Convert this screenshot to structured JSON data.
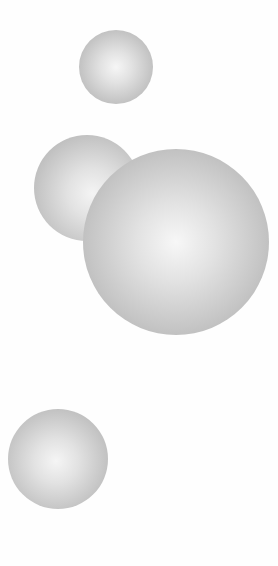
{
  "scene": {
    "width": 278,
    "height": 566,
    "background": "#fefefe",
    "spheres": [
      {
        "name": "sphere-top-small",
        "cx": 116,
        "cy": 67,
        "r": 37,
        "highlight_x": 50,
        "highlight_y": 50,
        "center_color": "#f6f6f6",
        "edge_color": "#acacac",
        "z": 1
      },
      {
        "name": "sphere-middle-left",
        "cx": 87,
        "cy": 188,
        "r": 53,
        "highlight_x": 55,
        "highlight_y": 55,
        "center_color": "#f4f4f4",
        "edge_color": "#aaaaaa",
        "z": 1
      },
      {
        "name": "sphere-large",
        "cx": 176,
        "cy": 242,
        "r": 93,
        "highlight_x": 50,
        "highlight_y": 50,
        "center_color": "#f7f7f7",
        "edge_color": "#a8a8a8",
        "z": 2
      },
      {
        "name": "sphere-bottom-left",
        "cx": 58,
        "cy": 459,
        "r": 50,
        "highlight_x": 48,
        "highlight_y": 52,
        "center_color": "#f5f5f5",
        "edge_color": "#ababab",
        "z": 1
      }
    ]
  }
}
